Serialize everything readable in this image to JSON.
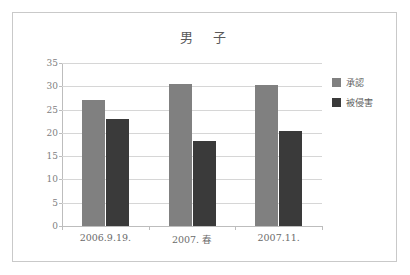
{
  "chart_data": {
    "type": "bar",
    "title": "男　子",
    "xlabel": "",
    "ylabel": "",
    "ylim": [
      0,
      35
    ],
    "ytick_step": 5,
    "yticks": [
      "35",
      "30",
      "25",
      "20",
      "15",
      "10",
      "5",
      "0"
    ],
    "grid": true,
    "legend_position": "right",
    "categories": [
      "2006.9.19.",
      "2007. 春",
      "2007.11."
    ],
    "series": [
      {
        "name": "承認",
        "color": "#808080",
        "values": [
          27.0,
          30.5,
          30.2
        ]
      },
      {
        "name": "被侵害",
        "color": "#3a3a3a",
        "values": [
          23.0,
          18.3,
          20.4
        ]
      }
    ]
  },
  "colors": {
    "series_0": "#808080",
    "series_1": "#3a3a3a",
    "gridline": "#d6d6d6",
    "axis": "#bdbdbd",
    "frame": "#c9c9c9",
    "title_text": "#595959",
    "tick_text": "#808080",
    "background": "#ffffff"
  }
}
